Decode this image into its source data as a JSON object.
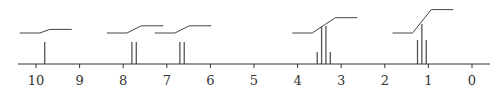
{
  "chart_data": {
    "type": "line",
    "title": "",
    "xlabel": "",
    "ylabel": "",
    "xlim": [
      10.4,
      -0.3
    ],
    "x_reversed": true,
    "grid": false,
    "legend": "none",
    "ticks": [
      10,
      9,
      8,
      7,
      6,
      5,
      4,
      3,
      2,
      1,
      0
    ],
    "tick_labels": [
      "10",
      "9",
      "8",
      "7",
      "6",
      "5",
      "4",
      "3",
      "2",
      "1",
      "0"
    ],
    "signals": [
      {
        "shift": 9.8,
        "multiplicity": "singlet",
        "peaks": [
          {
            "ppm": 9.8,
            "height": 0.55
          }
        ],
        "integration_rise": 0.2
      },
      {
        "shift": 7.75,
        "multiplicity": "doublet",
        "peaks": [
          {
            "ppm": 7.8,
            "height": 0.55
          },
          {
            "ppm": 7.7,
            "height": 0.55
          }
        ],
        "integration_rise": 0.4
      },
      {
        "shift": 6.65,
        "multiplicity": "doublet",
        "peaks": [
          {
            "ppm": 6.7,
            "height": 0.55
          },
          {
            "ppm": 6.6,
            "height": 0.55
          }
        ],
        "integration_rise": 0.4
      },
      {
        "shift": 3.4,
        "multiplicity": "quartet",
        "peaks": [
          {
            "ppm": 3.55,
            "height": 0.3
          },
          {
            "ppm": 3.45,
            "height": 0.95
          },
          {
            "ppm": 3.35,
            "height": 0.95
          },
          {
            "ppm": 3.25,
            "height": 0.3
          }
        ],
        "integration_rise": 0.85
      },
      {
        "shift": 1.15,
        "multiplicity": "triplet",
        "peaks": [
          {
            "ppm": 1.25,
            "height": 0.6
          },
          {
            "ppm": 1.15,
            "height": 1.0
          },
          {
            "ppm": 1.05,
            "height": 0.6
          }
        ],
        "integration_rise": 1.3
      }
    ]
  },
  "colors": {
    "axis": "#333333",
    "peaks": "#555555",
    "integration": "#444444"
  }
}
